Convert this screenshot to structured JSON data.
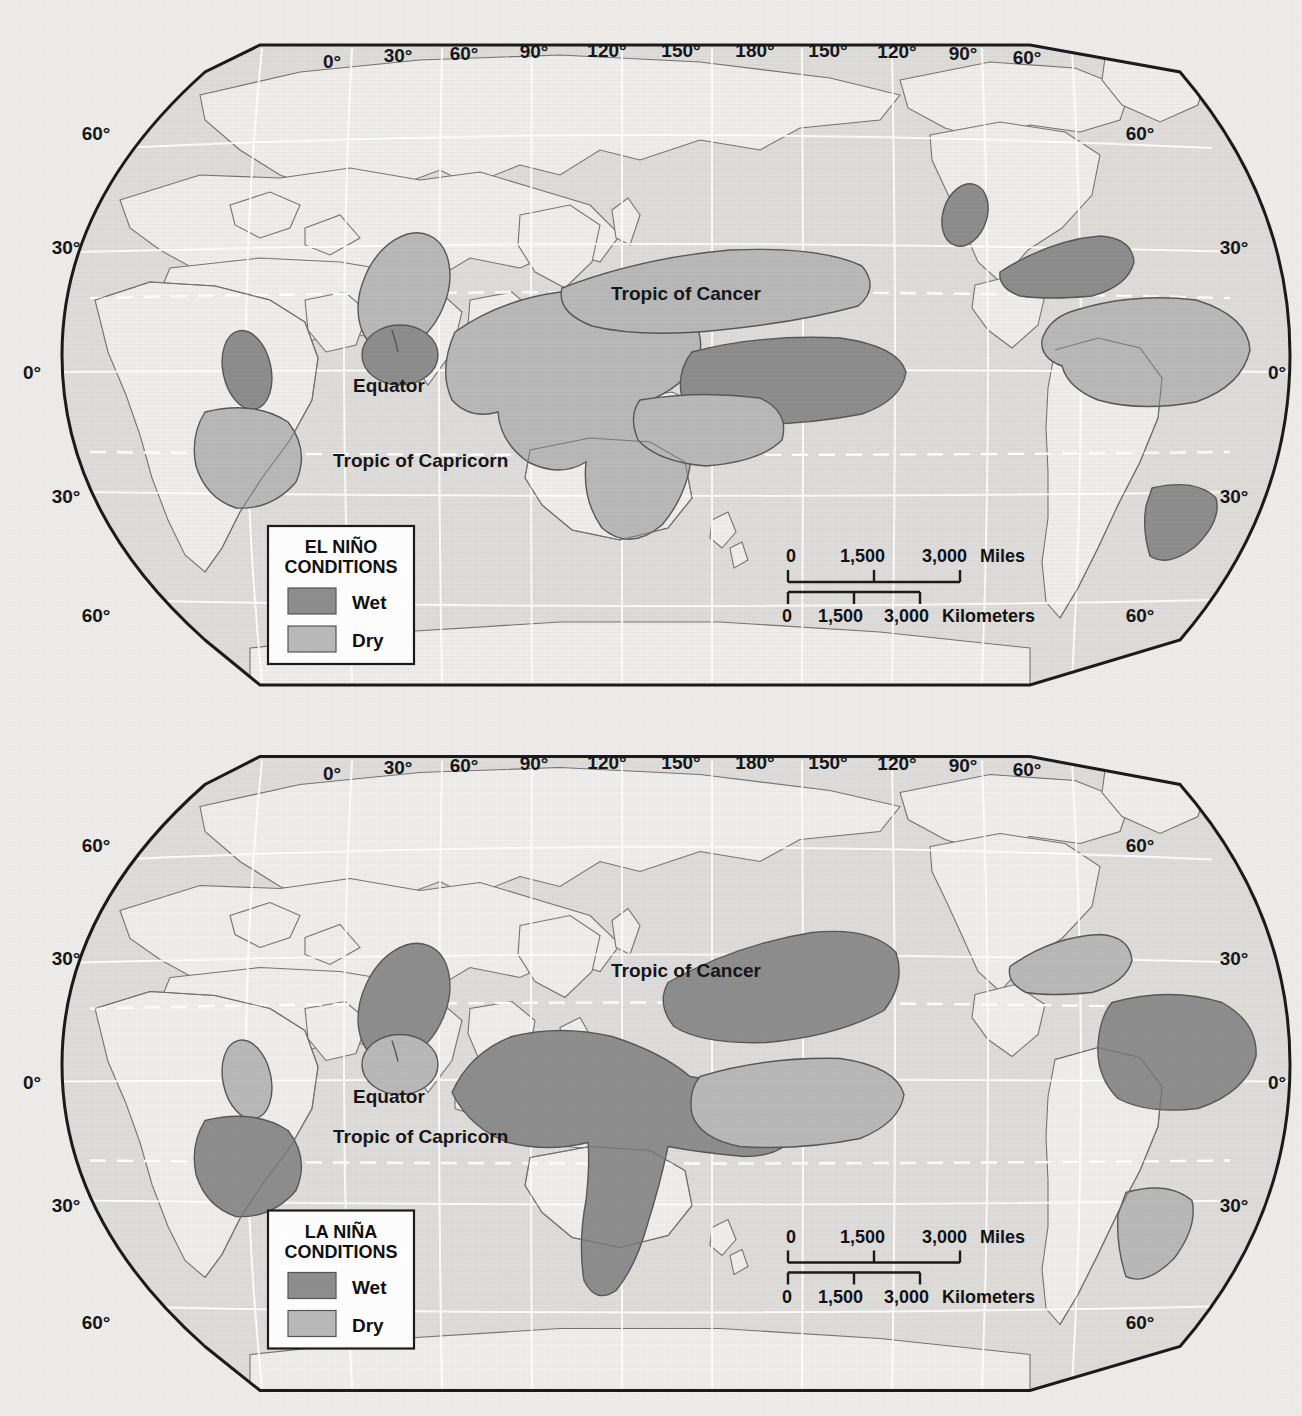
{
  "document": {
    "kind": "two-panel world map figure",
    "background_color": "#edecea"
  },
  "palette": {
    "wet_fill": "#8e8e8e",
    "dry_fill": "#b9b9b9",
    "ocean_fill": "#dedddb",
    "land_fill": "#eeedeb",
    "coastline": "#6d6d6d",
    "frame": "#1b1b1b",
    "graticule": "#ffffff",
    "legend_bg": "#ffffff"
  },
  "maps": [
    {
      "id": "el-nino",
      "legend": {
        "title_line1": "EL NIÑO",
        "title_line2": "CONDITIONS",
        "items": [
          {
            "label": "Wet",
            "color": "#8e8e8e"
          },
          {
            "label": "Dry",
            "color": "#b9b9b9"
          }
        ]
      },
      "scalebar": {
        "miles": {
          "ticks": [
            "0",
            "1,500",
            "3,000"
          ],
          "unit": "Miles"
        },
        "kilometers": {
          "ticks": [
            "0",
            "1,500",
            "3,000"
          ],
          "unit": "Kilometers"
        }
      },
      "longitude_labels": [
        "0°",
        "30°",
        "60°",
        "90°",
        "120°",
        "150°",
        "180°",
        "150°",
        "120°",
        "90°",
        "60°"
      ],
      "latitude_labels_left": [
        "60°",
        "30°",
        "0°",
        "30°",
        "60°"
      ],
      "latitude_labels_right": [
        "60°",
        "30°",
        "0°",
        "30°",
        "60°"
      ],
      "annotations": [
        {
          "text": "Tropic of Cancer"
        },
        {
          "text": "Equator"
        },
        {
          "text": "Tropic of Capricorn"
        }
      ]
    },
    {
      "id": "la-nina",
      "legend": {
        "title_line1": "LA NIÑA",
        "title_line2": "CONDITIONS",
        "items": [
          {
            "label": "Wet",
            "color": "#8e8e8e"
          },
          {
            "label": "Dry",
            "color": "#b9b9b9"
          }
        ]
      },
      "scalebar": {
        "miles": {
          "ticks": [
            "0",
            "1,500",
            "3,000"
          ],
          "unit": "Miles"
        },
        "kilometers": {
          "ticks": [
            "0",
            "1,500",
            "3,000"
          ],
          "unit": "Kilometers"
        }
      },
      "longitude_labels": [
        "0°",
        "30°",
        "60°",
        "90°",
        "120°",
        "150°",
        "180°",
        "150°",
        "120°",
        "90°",
        "60°"
      ],
      "latitude_labels_left": [
        "60°",
        "30°",
        "0°",
        "30°",
        "60°"
      ],
      "latitude_labels_right": [
        "60°",
        "30°",
        "0°",
        "30°",
        "60°"
      ],
      "annotations": [
        {
          "text": "Tropic of Cancer"
        },
        {
          "text": "Equator"
        },
        {
          "text": "Tropic of Capricorn"
        }
      ]
    }
  ]
}
